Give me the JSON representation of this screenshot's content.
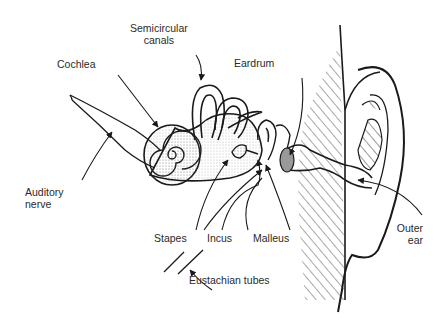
{
  "diagram": {
    "labels": {
      "semicircular_canals": "Semicircular\ncanals",
      "cochlea": "Cochlea",
      "eardrum": "Eardrum",
      "auditory_nerve": "Auditory\nnerve",
      "stapes": "Stapes",
      "incus": "Incus",
      "malleus": "Malleus",
      "outer_ear": "Outer\near",
      "eustachian_tubes": "Eustachian tubes"
    },
    "colors": {
      "line": "#1a1a1a",
      "text": "#2a2a2a",
      "background": "#ffffff",
      "shade": "#9a9a9a"
    }
  }
}
